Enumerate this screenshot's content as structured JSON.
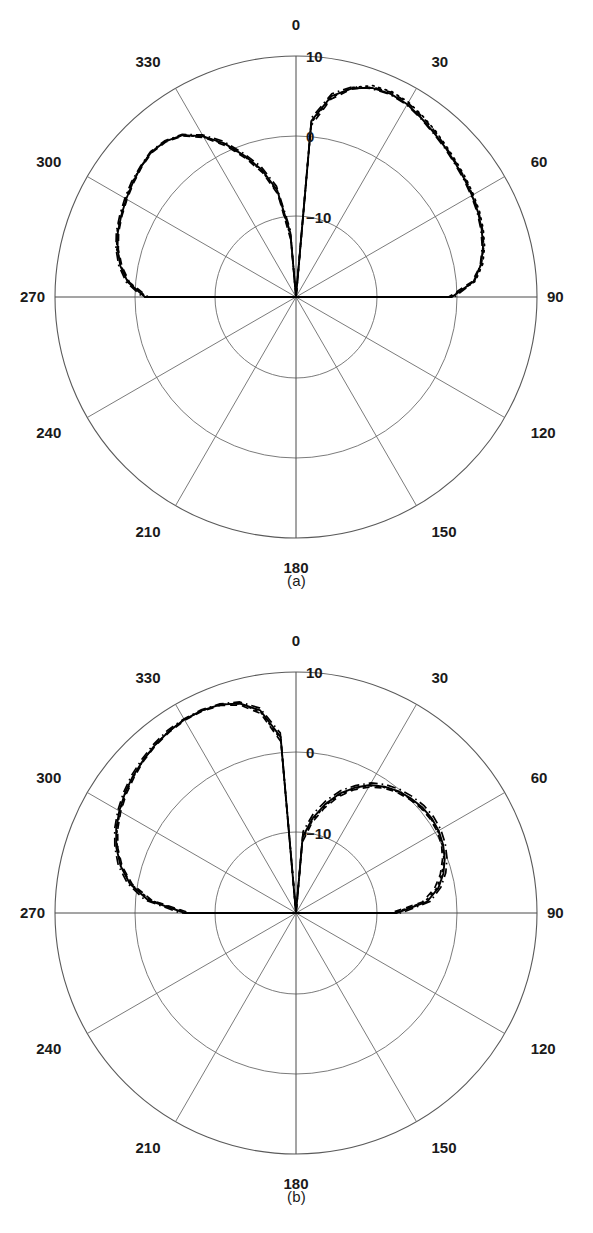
{
  "figure": {
    "type": "polar-radiation-pattern-figure",
    "panel_count": 2
  },
  "panels": [
    {
      "id": "a",
      "caption": "(a)",
      "angle_labels": [
        "0",
        "30",
        "60",
        "90",
        "120",
        "150",
        "180",
        "210",
        "240",
        "270",
        "300",
        "330"
      ],
      "radial_labels": [
        "10",
        "0",
        "-10"
      ],
      "radial_label_display": [
        "10",
        "0",
        "−10"
      ]
    },
    {
      "id": "b",
      "caption": "(b)",
      "angle_labels": [
        "0",
        "30",
        "60",
        "90",
        "120",
        "150",
        "180",
        "210",
        "240",
        "270",
        "300",
        "330"
      ],
      "radial_labels": [
        "10",
        "0",
        "-10"
      ],
      "radial_label_display": [
        "10",
        "0",
        "−10"
      ]
    }
  ],
  "chart_data": [
    {
      "type": "line",
      "subplot": "(a)",
      "polar": true,
      "title": "",
      "xlabel": "",
      "ylabel": "",
      "angle_unit": "degrees",
      "angle_direction": "clockwise",
      "angle_zero_at": "top",
      "angle_ticks": [
        0,
        30,
        60,
        90,
        120,
        150,
        180,
        210,
        240,
        270,
        300,
        330
      ],
      "radial_ticks": [
        -10,
        0,
        10
      ],
      "radial_tick_labels": [
        "−10",
        "0",
        "10"
      ],
      "rlim": [
        -20,
        10
      ],
      "radial_unit": "dB",
      "grid": true,
      "legend": "none",
      "series": [
        {
          "name": "solid",
          "style": "solid",
          "angles": [
            0,
            5,
            10,
            15,
            20,
            25,
            30,
            35,
            40,
            45,
            50,
            55,
            60,
            65,
            70,
            75,
            80,
            85,
            90,
            95,
            180,
            265,
            270,
            275,
            280,
            285,
            290,
            295,
            300,
            305,
            310,
            315,
            320,
            325,
            330,
            335,
            340,
            345,
            350,
            355,
            360
          ],
          "values": [
            -20,
            2.0,
            5.4,
            6.9,
            7.7,
            7.9,
            7.7,
            7.2,
            6.7,
            6.3,
            5.9,
            5.6,
            5.3,
            5.0,
            4.6,
            4.1,
            3.4,
            2.2,
            -0.6,
            -20,
            -20,
            -20,
            -1.2,
            1.0,
            2.2,
            3.0,
            3.6,
            4.0,
            4.4,
            4.8,
            5.2,
            5.5,
            5.3,
            4.6,
            3.1,
            1.1,
            -1.3,
            -3.6,
            -6.5,
            -12.0,
            -20
          ]
        },
        {
          "name": "dashed",
          "style": "dashed",
          "angles": [
            0,
            5,
            10,
            15,
            20,
            25,
            30,
            35,
            40,
            45,
            50,
            55,
            60,
            65,
            70,
            75,
            80,
            85,
            90,
            265,
            270,
            275,
            280,
            285,
            290,
            295,
            300,
            305,
            310,
            315,
            320,
            325,
            330,
            335,
            340,
            345,
            350,
            355,
            360
          ],
          "values": [
            -20,
            1.4,
            5.0,
            6.8,
            7.8,
            8.1,
            7.9,
            7.4,
            6.9,
            6.4,
            6.0,
            5.7,
            5.4,
            5.1,
            4.7,
            4.2,
            3.4,
            2.0,
            -1.0,
            -20,
            -1.6,
            0.8,
            2.0,
            2.9,
            3.5,
            3.9,
            4.3,
            4.7,
            5.1,
            5.4,
            5.2,
            4.5,
            2.9,
            0.8,
            -1.6,
            -4.0,
            -7.0,
            -13.0,
            -20
          ]
        },
        {
          "name": "dash-dot",
          "style": "dash-dot",
          "angles": [
            0,
            5,
            10,
            15,
            20,
            25,
            30,
            35,
            40,
            45,
            50,
            55,
            60,
            65,
            70,
            75,
            80,
            85,
            90,
            265,
            270,
            275,
            280,
            285,
            290,
            295,
            300,
            305,
            310,
            315,
            320,
            325,
            330,
            335,
            340,
            345,
            350,
            355,
            360
          ],
          "values": [
            -20,
            2.4,
            5.7,
            7.1,
            7.6,
            7.8,
            7.6,
            7.1,
            6.6,
            6.2,
            5.8,
            5.5,
            5.2,
            4.9,
            4.5,
            4.0,
            3.3,
            2.3,
            -0.3,
            -20,
            -0.9,
            1.2,
            2.4,
            3.2,
            3.8,
            4.2,
            4.6,
            5.0,
            5.3,
            5.6,
            5.4,
            4.7,
            3.3,
            1.4,
            -1.0,
            -3.2,
            -6.0,
            -11.5,
            -20
          ]
        },
        {
          "name": "dotted",
          "style": "dotted",
          "angles": [
            0,
            5,
            10,
            15,
            20,
            25,
            30,
            35,
            40,
            45,
            50,
            55,
            60,
            65,
            70,
            75,
            80,
            85,
            90,
            265,
            270,
            275,
            280,
            285,
            290,
            295,
            300,
            305,
            310,
            315,
            320,
            325,
            330,
            335,
            340,
            345,
            350,
            355,
            360
          ],
          "values": [
            -20,
            1.8,
            5.2,
            7.0,
            8.0,
            8.2,
            8.0,
            7.5,
            7.0,
            6.5,
            6.1,
            5.8,
            5.5,
            5.2,
            4.8,
            4.3,
            3.6,
            2.4,
            -0.8,
            -20,
            -1.4,
            0.9,
            2.1,
            3.1,
            3.7,
            4.1,
            4.5,
            4.9,
            5.2,
            5.5,
            5.3,
            4.6,
            3.0,
            1.0,
            -1.4,
            -3.8,
            -6.8,
            -12.5,
            -20
          ]
        }
      ],
      "main_lobe": {
        "center_deg": 25,
        "peak_db": 7.9
      },
      "second_lobe": {
        "center_deg": 315,
        "peak_db": 5.5
      },
      "null_deg": [
        0,
        345,
        90,
        270
      ]
    },
    {
      "type": "line",
      "subplot": "(b)",
      "polar": true,
      "title": "",
      "xlabel": "",
      "ylabel": "",
      "angle_unit": "degrees",
      "angle_direction": "clockwise",
      "angle_zero_at": "top",
      "angle_ticks": [
        0,
        30,
        60,
        90,
        120,
        150,
        180,
        210,
        240,
        270,
        300,
        330
      ],
      "radial_ticks": [
        -10,
        0,
        10
      ],
      "radial_tick_labels": [
        "−10",
        "0",
        "10"
      ],
      "rlim": [
        -20,
        10
      ],
      "radial_unit": "dB",
      "grid": true,
      "legend": "none",
      "series": [
        {
          "name": "solid",
          "style": "solid",
          "angles": [
            0,
            5,
            10,
            15,
            20,
            25,
            30,
            35,
            40,
            45,
            50,
            55,
            60,
            65,
            70,
            75,
            80,
            85,
            90,
            270,
            275,
            280,
            285,
            290,
            295,
            300,
            305,
            310,
            315,
            320,
            325,
            330,
            335,
            340,
            345,
            350,
            355,
            360
          ],
          "values": [
            -20,
            -10.5,
            -8.0,
            -6.0,
            -4.2,
            -2.8,
            -1.6,
            -0.8,
            -0.2,
            0.2,
            0.5,
            0.6,
            0.5,
            0.2,
            -0.3,
            -1.0,
            -2.0,
            -3.6,
            -7.5,
            -6.2,
            -1.5,
            1.0,
            2.6,
            3.8,
            4.7,
            5.4,
            6.0,
            6.5,
            6.9,
            7.3,
            7.6,
            7.8,
            7.8,
            7.6,
            7.0,
            5.6,
            2.0,
            -20
          ]
        },
        {
          "name": "dashed",
          "style": "dashed",
          "angles": [
            0,
            5,
            10,
            15,
            20,
            25,
            30,
            35,
            40,
            45,
            50,
            55,
            60,
            65,
            70,
            75,
            80,
            85,
            90,
            270,
            275,
            280,
            285,
            290,
            295,
            300,
            305,
            310,
            315,
            320,
            325,
            330,
            335,
            340,
            345,
            350,
            355,
            360
          ],
          "values": [
            -20,
            -11.2,
            -8.6,
            -6.5,
            -4.6,
            -3.1,
            -1.9,
            -1.0,
            -0.4,
            0.0,
            0.3,
            0.4,
            0.3,
            0.0,
            -0.6,
            -1.4,
            -2.5,
            -4.2,
            -8.2,
            -6.8,
            -2.0,
            0.7,
            2.4,
            3.6,
            4.5,
            5.2,
            5.8,
            6.3,
            6.8,
            7.2,
            7.5,
            7.7,
            7.7,
            7.5,
            6.8,
            5.2,
            1.4,
            -20
          ]
        },
        {
          "name": "dash-dot",
          "style": "dash-dot",
          "angles": [
            0,
            5,
            10,
            15,
            20,
            25,
            30,
            35,
            40,
            45,
            50,
            55,
            60,
            65,
            70,
            75,
            80,
            85,
            90,
            270,
            275,
            280,
            285,
            290,
            295,
            300,
            305,
            310,
            315,
            320,
            325,
            330,
            335,
            340,
            345,
            350,
            355,
            360
          ],
          "values": [
            -20,
            -9.8,
            -7.4,
            -5.5,
            -3.8,
            -2.5,
            -1.3,
            -0.5,
            0.1,
            0.5,
            0.8,
            0.9,
            0.8,
            0.5,
            0.0,
            -0.7,
            -1.7,
            -3.2,
            -6.9,
            -5.6,
            -1.1,
            1.3,
            2.9,
            4.0,
            4.9,
            5.6,
            6.2,
            6.7,
            7.1,
            7.5,
            7.8,
            7.9,
            7.9,
            7.7,
            7.2,
            5.9,
            2.5,
            -20
          ]
        },
        {
          "name": "dotted",
          "style": "dotted",
          "angles": [
            0,
            5,
            10,
            15,
            20,
            25,
            30,
            35,
            40,
            45,
            50,
            55,
            60,
            65,
            70,
            75,
            80,
            85,
            90,
            270,
            275,
            280,
            285,
            290,
            295,
            300,
            305,
            310,
            315,
            320,
            325,
            330,
            335,
            340,
            345,
            350,
            355,
            360
          ],
          "values": [
            -20,
            -10.8,
            -8.3,
            -6.2,
            -4.4,
            -2.9,
            -1.7,
            -0.9,
            -0.3,
            0.1,
            0.4,
            0.5,
            0.4,
            0.1,
            -0.4,
            -1.2,
            -2.2,
            -3.9,
            -7.8,
            -6.5,
            -1.8,
            0.9,
            2.5,
            3.7,
            4.6,
            5.3,
            5.9,
            6.4,
            6.9,
            7.3,
            7.6,
            7.8,
            7.8,
            7.6,
            7.0,
            5.4,
            1.7,
            -20
          ]
        }
      ],
      "main_lobe": {
        "center_deg": 332,
        "peak_db": 7.8
      },
      "second_lobe": {
        "center_deg": 55,
        "peak_db": 0.6
      },
      "null_deg": [
        0,
        90,
        265
      ]
    }
  ],
  "geometry": {
    "center_x": 296,
    "center_y": 297,
    "outer_radius": 241,
    "ring_radii": [
      81,
      161,
      241
    ],
    "ring_values": [
      -10,
      0,
      10
    ],
    "spoke_step_deg": 30
  }
}
